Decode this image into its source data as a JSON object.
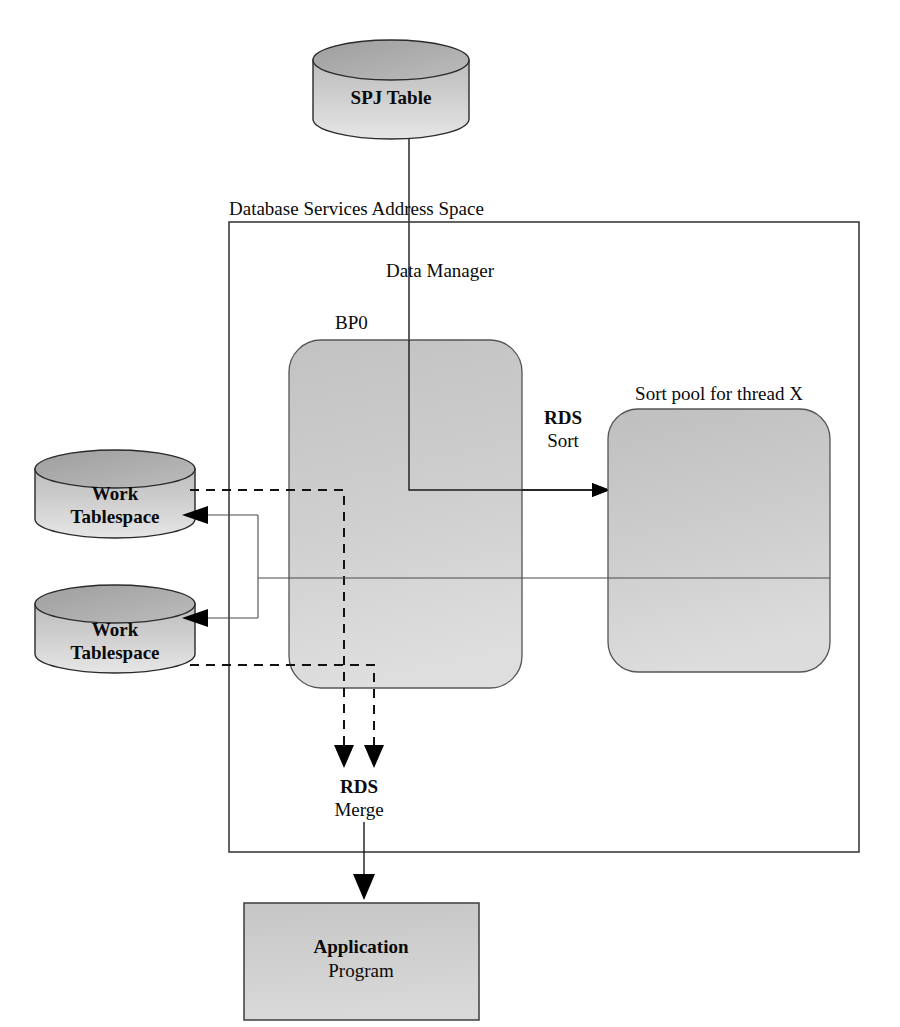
{
  "diagram": {
    "title_text": "DB2 sort processing flow",
    "nodes": {
      "spj_table": {
        "label": "SPJ Table",
        "shape": "cylinder"
      },
      "outer_box": {
        "label": "Database Services Address Space",
        "shape": "rectangle"
      },
      "data_manager": {
        "label": "Data Manager",
        "shape": "rectangle"
      },
      "buffer_pool": {
        "label": "BP0",
        "shape": "rounded-rectangle"
      },
      "sort_pool": {
        "label": "Sort pool for thread X",
        "shape": "rounded-rectangle"
      },
      "work_tablespace_1": {
        "label_line1": "Work",
        "label_line2": "Tablespace",
        "shape": "cylinder"
      },
      "work_tablespace_2": {
        "label_line1": "Work",
        "label_line2": "Tablespace",
        "shape": "cylinder"
      },
      "application_program": {
        "label_line1": "Application",
        "label_line2": "Program",
        "shape": "rectangle"
      }
    },
    "edges": {
      "rds_sort": {
        "label_line1": "RDS",
        "label_line2": "Sort",
        "style": "solid",
        "direction": "right"
      },
      "rds_merge": {
        "label_line1": "RDS",
        "label_line2": "Merge",
        "style": "dashed",
        "direction": "down"
      }
    },
    "colors": {
      "fill_gray": "#c9c9c9",
      "fill_light_gray": "#d8d8d8",
      "stroke": "#1a1a1a",
      "background": "#ffffff",
      "text": "#0a0a0a"
    }
  }
}
